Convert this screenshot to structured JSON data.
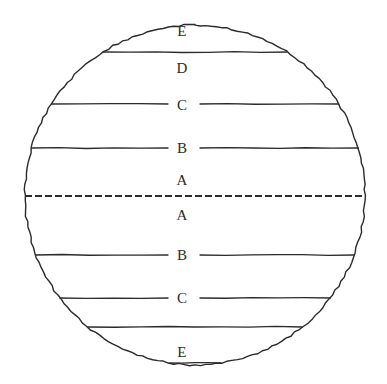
{
  "diagram": {
    "background_color": "#ffffff",
    "stroke_color": "#2b2b2b",
    "circle": {
      "center_x": 195,
      "center_y": 195,
      "radius": 170,
      "stroke_width": 1.4,
      "name": "globe-outline"
    },
    "equator": {
      "label": "equator-dashed-line",
      "y": 196,
      "dash": "7 3",
      "stroke_width": 2.2
    },
    "zones": [
      {
        "id": "north-e",
        "label": "E",
        "label_x": 182,
        "label_y": 31,
        "hemisphere": "north",
        "line_y": 52,
        "line_style": "full",
        "line_gap": false
      },
      {
        "id": "north-d",
        "label": "D",
        "label_x": 182,
        "label_y": 68,
        "hemisphere": "north",
        "line_y": 104,
        "line_style": "split",
        "line_gap": true
      },
      {
        "id": "north-c",
        "label": "C",
        "label_x": 182,
        "label_y": 105,
        "hemisphere": "north",
        "line_y": 148,
        "line_style": "split",
        "line_gap": true
      },
      {
        "id": "north-b",
        "label": "B",
        "label_x": 182,
        "label_y": 148,
        "hemisphere": "north",
        "line_y": 196,
        "line_style": "dashed",
        "line_gap": false
      },
      {
        "id": "north-a",
        "label": "A",
        "label_x": 182,
        "label_y": 180,
        "hemisphere": "north",
        "line_y": 196,
        "line_style": "dashed",
        "line_gap": false
      },
      {
        "id": "south-a",
        "label": "A",
        "label_x": 182,
        "label_y": 215,
        "hemisphere": "south",
        "line_y": 255,
        "line_style": "split",
        "line_gap": true
      },
      {
        "id": "south-b",
        "label": "B",
        "label_x": 182,
        "label_y": 255,
        "hemisphere": "south",
        "line_y": 298,
        "line_style": "split",
        "line_gap": true
      },
      {
        "id": "south-c",
        "label": "C",
        "label_x": 182,
        "label_y": 298,
        "hemisphere": "south",
        "line_y": 327,
        "line_style": "full",
        "line_gap": false
      },
      {
        "id": "south-e",
        "label": "E",
        "label_x": 182,
        "label_y": 352,
        "hemisphere": "south",
        "line_y": 363,
        "line_style": "full",
        "line_gap": false
      }
    ],
    "latitude_lines": [
      {
        "id": "line-top-e-d",
        "y": 52,
        "gap": false,
        "name": "latitude-line-e-d-north"
      },
      {
        "id": "line-d-c",
        "y": 104,
        "gap": true,
        "name": "latitude-line-d-c-north"
      },
      {
        "id": "line-c-b",
        "y": 148,
        "gap": true,
        "name": "latitude-line-c-b-north"
      },
      {
        "id": "line-a-b-south",
        "y": 255,
        "gap": true,
        "name": "latitude-line-a-b-south"
      },
      {
        "id": "line-b-c-south",
        "y": 298,
        "gap": true,
        "name": "latitude-line-b-c-south"
      },
      {
        "id": "line-c-e-south",
        "y": 327,
        "gap": false,
        "name": "latitude-line-c-e-south"
      },
      {
        "id": "line-bottom-e",
        "y": 363,
        "gap": false,
        "name": "latitude-line-bottom-e"
      }
    ],
    "label_gap_half_width": 14
  }
}
